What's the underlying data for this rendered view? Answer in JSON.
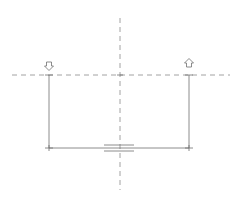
{
  "diagram": {
    "type": "wiring-schematic",
    "stroke_color": "#6e6e6e",
    "dash_color": "#8a8a8a",
    "centerline_vertical": {
      "x": 120,
      "y1": 18,
      "y2": 190
    },
    "centerline_horizontal": {
      "y": 75,
      "x1": 12,
      "x2": 230
    },
    "left_lead": {
      "x": 49,
      "y1": 75,
      "y2": 148,
      "arrow": "down-arrow"
    },
    "right_lead": {
      "x": 189,
      "y1": 75,
      "y2": 148,
      "arrow": "up-arrow"
    },
    "bottom_wire": {
      "y": 148,
      "x1": 49,
      "x2": 189
    },
    "junction_symbol": {
      "type": "capacitor-plates",
      "x1": 104,
      "x2": 134,
      "y_top": 145,
      "y_bottom": 151
    }
  }
}
